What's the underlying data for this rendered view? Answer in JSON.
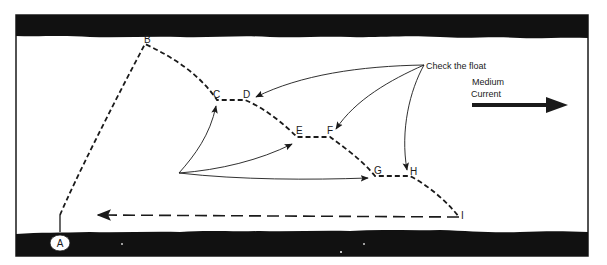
{
  "diagram": {
    "points": [
      {
        "id": "A",
        "label": "A"
      },
      {
        "id": "B",
        "label": "B"
      },
      {
        "id": "C",
        "label": "C"
      },
      {
        "id": "D",
        "label": "D"
      },
      {
        "id": "E",
        "label": "E"
      },
      {
        "id": "F",
        "label": "F"
      },
      {
        "id": "G",
        "label": "G"
      },
      {
        "id": "H",
        "label": "H"
      },
      {
        "id": "I",
        "label": "I"
      }
    ],
    "annotations": {
      "check_float": "Check the float",
      "current_line1": "Medium",
      "current_line2": "Current"
    },
    "colors": {
      "ink": "#1a1a1a",
      "band": "#111111",
      "background": "#ffffff"
    }
  }
}
